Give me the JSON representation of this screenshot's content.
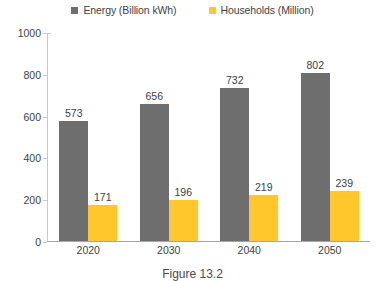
{
  "chart_data": {
    "type": "bar",
    "title": "",
    "xlabel": "",
    "ylabel": "",
    "ylim": [
      0,
      1000
    ],
    "ytick_step": 200,
    "yticks": [
      1000,
      800,
      600,
      400,
      200,
      0
    ],
    "grid": false,
    "legend_position": "top-center",
    "categories": [
      "2020",
      "2030",
      "2040",
      "2050"
    ],
    "series": [
      {
        "name": "Energy (Billion kWh)",
        "color": "#6e6e6e",
        "values": [
          573,
          656,
          732,
          802
        ]
      },
      {
        "name": "Households (Million)",
        "color": "#ffc72c",
        "values": [
          171,
          196,
          219,
          239
        ]
      }
    ]
  },
  "legend": {
    "items": [
      {
        "label": "Energy (Billion kWh)",
        "color": "#6e6e6e",
        "marker": "square-marker"
      },
      {
        "label": "Households (Million)",
        "color": "#ffc72c",
        "marker": "square-marker"
      }
    ]
  },
  "caption": {
    "text": "Figure 13.2"
  }
}
